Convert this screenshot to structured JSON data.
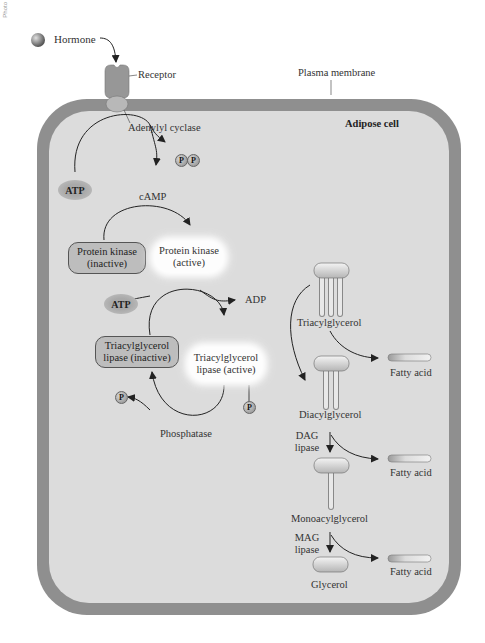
{
  "figure": {
    "side_credit": "Photo",
    "hormone_label": "Hormone",
    "receptor_label": "Receptor",
    "adenylyl_cyclase_label": "Adenylyl cyclase",
    "plasma_membrane_label": "Plasma membrane",
    "cell_label": "Adipose cell"
  },
  "camp_step": {
    "atp": "ATP",
    "pp": [
      "P",
      "P"
    ],
    "camp": "cAMP"
  },
  "kinase_step": {
    "inactive_line1": "Protein kinase",
    "inactive_line2": "(inactive)",
    "active_line1": "Protein kinase",
    "active_line2": "(active)"
  },
  "lipase_step": {
    "atp": "ATP",
    "adp": "ADP",
    "inactive_line1": "Triacylglycerol",
    "inactive_line2": "lipase (inactive)",
    "active_line1": "Triacylglycerol",
    "active_line2": "lipase (active)",
    "phosphate_released": "P",
    "phosphate_attached": "P",
    "phosphatase": "Phosphatase"
  },
  "lipolysis": {
    "triacylglycerol": "Triacylglycerol",
    "diacylglycerol": "Diacylglycerol",
    "monoacylglycerol": "Monoacylglycerol",
    "glycerol": "Glycerol",
    "dag_lipase_line1": "DAG",
    "dag_lipase_line2": "lipase",
    "mag_lipase_line1": "MAG",
    "mag_lipase_line2": "lipase",
    "fatty_acids": [
      "Fatty acid",
      "Fatty acid",
      "Fatty acid"
    ]
  },
  "colors": {
    "membrane": "#8f8f8f",
    "cytoplasm": "#dcdcdc",
    "inactive_box": "#bdbdbd",
    "active_glow": "#ffffff",
    "arrow": "#222222"
  }
}
